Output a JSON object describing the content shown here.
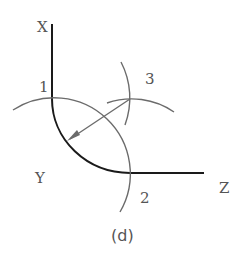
{
  "figure": {
    "caption": "(d)",
    "labels": {
      "x_axis": "X",
      "y_corner": "Y",
      "z_axis": "Z",
      "point_1": "1",
      "point_2": "2",
      "point_3": "3"
    },
    "colors": {
      "main_line": "#1a1a1a",
      "construction_line": "#6b6b6b",
      "label": "#555555"
    }
  }
}
